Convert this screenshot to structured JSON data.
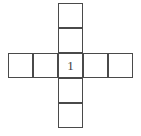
{
  "figure": {
    "name": "cross-polyomino",
    "shape_type": "plus-cross",
    "cell_size_px": 25,
    "stroke_color": "#4a4a4a",
    "fill_color": "#ffffff",
    "background_color": "#ffffff",
    "grid_columns": 5,
    "grid_rows": 5,
    "total_squares": 9,
    "vertical_arm_squares": 5,
    "horizontal_arm_squares": 5,
    "center_label": "1",
    "cells": [
      {
        "id": "cell-top-2",
        "row": 0,
        "col": 2,
        "label": ""
      },
      {
        "id": "cell-top-1",
        "row": 1,
        "col": 2,
        "label": ""
      },
      {
        "id": "cell-up",
        "row": 2,
        "col": 2,
        "label": ""
      },
      {
        "id": "cell-left-2",
        "row": 3,
        "col": 0,
        "label": ""
      },
      {
        "id": "cell-left-1",
        "row": 3,
        "col": 1,
        "label": ""
      },
      {
        "id": "cell-center",
        "row": 3,
        "col": 2,
        "label": "1"
      },
      {
        "id": "cell-right-1",
        "row": 3,
        "col": 3,
        "label": ""
      },
      {
        "id": "cell-right-2",
        "row": 3,
        "col": 4,
        "label": ""
      },
      {
        "id": "cell-down-1",
        "row": 4,
        "col": 2,
        "label": ""
      },
      {
        "id": "cell-down-2",
        "row": 5,
        "col": 2,
        "label": ""
      }
    ]
  }
}
